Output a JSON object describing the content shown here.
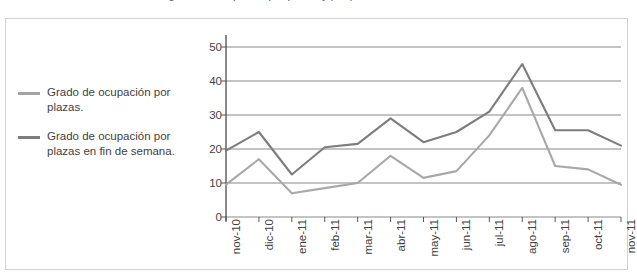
{
  "top_clipped_caption": "Gráfico 4: grado de ocupación por plazas y por plazas en fin de semana.",
  "legend": {
    "position": "left",
    "entries": [
      {
        "label": "Grado de ocupación por plazas.",
        "color": "#a3a3a3",
        "swatch_name": "legend-swatch-plazas"
      },
      {
        "label": "Grado de ocupación por plazas en fin de semana.",
        "color": "#7d7d7d",
        "swatch_name": "legend-swatch-fin-de-semana"
      }
    ]
  },
  "chart_data": {
    "type": "line",
    "title": "",
    "subtitle": "",
    "xlabel": "",
    "ylabel": "",
    "grid": true,
    "legend_position": "left",
    "ylim": [
      0,
      50
    ],
    "yticks": [
      0,
      10,
      20,
      30,
      40,
      50
    ],
    "categories": [
      "nov-10",
      "dic-10",
      "ene-11",
      "feb-11",
      "mar-11",
      "abr-11",
      "may-11",
      "jun-11",
      "jul-11",
      "ago-11",
      "sep-11",
      "oct-11",
      "nov-11"
    ],
    "series": [
      {
        "name": "Grado de ocupación por plazas.",
        "color": "#7d7d7d",
        "values": [
          19.5,
          25,
          12.5,
          20.5,
          21.5,
          29,
          22,
          25,
          31,
          45,
          25.5,
          25.5,
          21
        ]
      },
      {
        "name": "Grado de ocupación por plazas en fin de semana.",
        "color": "#a8a8a8",
        "values": [
          9.5,
          17,
          7,
          8.5,
          10,
          18,
          11.5,
          13.5,
          24,
          38,
          15,
          14,
          9.5
        ]
      }
    ]
  },
  "axes": {
    "y_tick_labels": [
      "50",
      "40",
      "30",
      "20",
      "10",
      "0"
    ],
    "x_tick_labels": [
      "nov-10",
      "dic-10",
      "ene-11",
      "feb-11",
      "mar-11",
      "abr-11",
      "may-11",
      "jun-11",
      "jul-11",
      "ago-11",
      "sep-11",
      "oct-11",
      "nov-11"
    ]
  },
  "colors": {
    "grid": "#7a7a7a",
    "axis": "#555555",
    "frame": "#d2d2d2",
    "text": "#3f3f3f",
    "background": "#ffffff"
  }
}
